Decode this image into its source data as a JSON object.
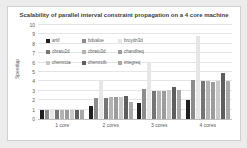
{
  "chart": {
    "title": "Scalability of parallel interval constraint propagation on a 4 core machine",
    "ylabel": "Speedup"
  },
  "chart_data": {
    "type": "bar",
    "title": "Scalability of parallel interval constraint propagation on a 4 core machine",
    "xlabel": "",
    "ylabel": "Speedup",
    "categories": [
      "1 core",
      "2 cores",
      "3 cores",
      "4 cores"
    ],
    "series": [
      {
        "name": "artif",
        "color": "#1f1f1f",
        "values": [
          1.0,
          1.4,
          1.7,
          2.0
        ]
      },
      {
        "name": "bdvalue",
        "color": "#8c8c8c",
        "values": [
          1.0,
          2.2,
          3.2,
          4.2
        ]
      },
      {
        "name": "broydn3d",
        "color": "#e6e6e6",
        "values": [
          1.0,
          4.0,
          6.1,
          8.8
        ]
      },
      {
        "name": "cbratu2d",
        "color": "#757575",
        "values": [
          1.0,
          2.2,
          3.0,
          4.0
        ]
      },
      {
        "name": "cbratu3d",
        "color": "#b3b3b3",
        "values": [
          1.0,
          2.3,
          3.0,
          4.0
        ]
      },
      {
        "name": "chandheq",
        "color": "#9c9c9c",
        "values": [
          1.0,
          2.3,
          3.0,
          3.9
        ]
      },
      {
        "name": "chemrcta",
        "color": "#c9c9c9",
        "values": [
          1.0,
          2.35,
          3.1,
          4.0
        ]
      },
      {
        "name": "chemrctb",
        "color": "#5e5e5e",
        "values": [
          1.0,
          2.4,
          3.4,
          4.9
        ]
      },
      {
        "name": "integreq",
        "color": "#a8a8a8",
        "values": [
          1.0,
          1.8,
          3.1,
          4.0
        ]
      }
    ],
    "ylim": [
      0,
      10
    ],
    "yticks": [
      0,
      1,
      2,
      3,
      4,
      5,
      6,
      7,
      8,
      9,
      10
    ],
    "grid": true,
    "legend_position": "inside-top-left",
    "legend_columns": 3
  }
}
